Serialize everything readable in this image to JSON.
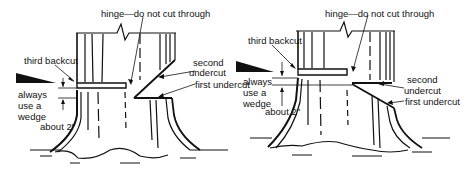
{
  "figure": {
    "colors": {
      "ink": "#111111",
      "background": "#ffffff"
    },
    "panels": [
      {
        "id": "left",
        "labels": {
          "hinge": "hinge—do not cut through",
          "third_backcut": "third backcut",
          "second_undercut_1": "second",
          "second_undercut_2": "undercut",
          "first_undercut": "first undercut",
          "wedge_1": "always",
          "wedge_2": "use a",
          "wedge_3": "wedge",
          "about": "about 2\""
        }
      },
      {
        "id": "right",
        "labels": {
          "hinge": "hinge—do not cut through",
          "third_backcut": "third backcut",
          "second_undercut_1": "second",
          "second_undercut_2": "undercut",
          "first_undercut": "first undercut",
          "wedge_1": "always",
          "wedge_2": "use a",
          "wedge_3": "wedge",
          "about": "about 2\""
        }
      }
    ]
  }
}
